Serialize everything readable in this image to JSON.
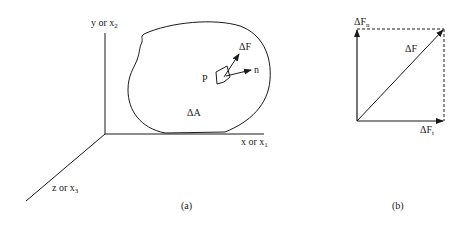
{
  "figure_a": {
    "axes": {
      "y_label": "y or x",
      "y_sub": "2",
      "x_label": "x or x",
      "x_sub": "1",
      "z_label": "z or x",
      "z_sub": "3"
    },
    "body_labels": {
      "point": "P",
      "area": "ΔA",
      "force": "ΔF",
      "normal": "n"
    },
    "caption": "(a)"
  },
  "figure_b": {
    "labels": {
      "normal_component": "ΔF",
      "normal_sub": "n",
      "resultant": "ΔF",
      "tangential_component": "ΔF",
      "tangential_sub": "t"
    },
    "caption": "(b)"
  },
  "colors": {
    "stroke": "#1a1a1a",
    "background": "#ffffff"
  }
}
